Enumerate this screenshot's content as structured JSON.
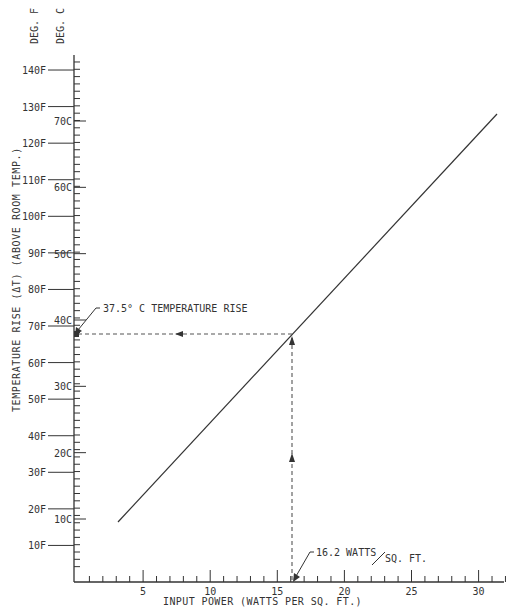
{
  "chart_data": {
    "type": "line",
    "title": "",
    "xlabel": "INPUT POWER (WATTS PER SQ. FT.)",
    "ylabel": "TEMPERATURE RISE (ΔT) (ABOVE ROOM TEMP.)",
    "scale_headers": [
      "DEG. F",
      "DEG. C"
    ],
    "xlim": [
      0,
      32
    ],
    "x_ticks": [
      5,
      10,
      15,
      20,
      25,
      30
    ],
    "x_tick_labels": [
      "5",
      "10",
      "15",
      "20",
      "25",
      "30"
    ],
    "ylim_F": [
      0,
      144
    ],
    "y_ticks_F": [
      10,
      20,
      30,
      40,
      50,
      60,
      70,
      80,
      90,
      100,
      110,
      120,
      130,
      140
    ],
    "y_tick_labels_F": [
      "10F",
      "20F",
      "30F",
      "40F",
      "50F",
      "60F",
      "70F",
      "80F",
      "90F",
      "100F",
      "110F",
      "120F",
      "130F",
      "140F"
    ],
    "y_ticks_C": [
      10,
      20,
      30,
      40,
      50,
      60,
      70
    ],
    "y_tick_labels_C": [
      "10C",
      "20C",
      "30C",
      "40C",
      "50C",
      "60C",
      "70C"
    ],
    "grid": false,
    "series": [
      {
        "name": "Temperature rise vs input power",
        "x": [
          3.4,
          16.2,
          31.6
        ],
        "y_F": [
          17.5,
          67.5,
          127.5
        ],
        "y_C": [
          -8.1,
          19.7,
          53.1
        ]
      }
    ],
    "annotations": [
      {
        "text": "37.5° C TEMPERATURE RISE",
        "points_to": {
          "x": 0,
          "y_F": 67.5
        }
      },
      {
        "text": "16.2 WATTS/SQ. FT.",
        "points_to": {
          "x": 16.2,
          "y_F": 0
        }
      }
    ],
    "reference_lines": [
      {
        "type": "horizontal-dashed",
        "y_F": 67.5,
        "from_x": 0,
        "to_x": 16.2,
        "arrow": "left"
      },
      {
        "type": "vertical-dashed",
        "x": 16.2,
        "from_y_F": 0,
        "to_y_F": 67.5,
        "arrow": "up"
      }
    ]
  },
  "labels": {
    "deg_f": "DEG. F",
    "deg_c": "DEG. C",
    "ylabel": "TEMPERATURE RISE (ΔT) (ABOVE ROOM TEMP.)",
    "xlabel": "INPUT POWER (WATTS PER SQ. FT.)",
    "annotation_temp": "37.5° C TEMPERATURE RISE",
    "annotation_watts_a": "16.2 WATTS",
    "annotation_watts_b": "SQ. FT."
  },
  "colors": {
    "ink": "#333333",
    "background": "#ffffff"
  }
}
